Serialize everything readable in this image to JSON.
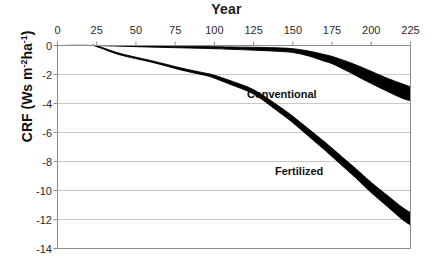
{
  "chart_data": {
    "type": "line",
    "title": "Year",
    "xlabel": "Year",
    "ylabel": "CRF (Ws m-2 ha-1)",
    "ylabel_parts": {
      "prefix": "CRF (Ws m",
      "sup1": "-2",
      "mid": "ha",
      "sup2": "-1",
      "suffix": ")"
    },
    "x_axis_position": "top",
    "xlim": [
      0,
      225
    ],
    "ylim": [
      -14,
      0
    ],
    "xticks": [
      0,
      25,
      50,
      75,
      100,
      125,
      150,
      175,
      200,
      225
    ],
    "xtick_labels": [
      "0",
      "25",
      "50",
      "75",
      "100",
      "125",
      "150",
      "175",
      "200",
      "225"
    ],
    "yticks": [
      0,
      -2,
      -4,
      -6,
      -8,
      -10,
      -12,
      -14
    ],
    "ytick_labels": [
      "0",
      "-2",
      "-4",
      "-6",
      "-8",
      "-10",
      "-12",
      "-14"
    ],
    "grid": "horizontal",
    "grid_color": "#c8c8c8",
    "axis_color": "#808080",
    "legend_position": "inline-annotations",
    "series": [
      {
        "name": "Conventional",
        "color": "#000000",
        "style": "band",
        "x": [
          0,
          25,
          50,
          75,
          100,
          110,
          125,
          140,
          150,
          160,
          170,
          175,
          185,
          195,
          200,
          210,
          220,
          225
        ],
        "values": [
          0.0,
          0.0,
          -0.05,
          -0.1,
          -0.15,
          -0.18,
          -0.22,
          -0.28,
          -0.35,
          -0.55,
          -0.85,
          -1.0,
          -1.45,
          -1.95,
          -2.2,
          -2.7,
          -3.15,
          -3.3
        ],
        "upper": [
          0.0,
          0.0,
          -0.02,
          -0.05,
          -0.08,
          -0.1,
          -0.12,
          -0.16,
          -0.22,
          -0.38,
          -0.62,
          -0.75,
          -1.12,
          -1.55,
          -1.78,
          -2.25,
          -2.65,
          -2.85
        ],
        "lower": [
          0.0,
          0.0,
          -0.08,
          -0.15,
          -0.22,
          -0.26,
          -0.32,
          -0.4,
          -0.48,
          -0.72,
          -1.08,
          -1.25,
          -1.78,
          -2.35,
          -2.62,
          -3.15,
          -3.65,
          -3.8
        ]
      },
      {
        "name": "Fertilized",
        "color": "#000000",
        "style": "band",
        "x": [
          0,
          20,
          25,
          40,
          60,
          80,
          95,
          100,
          110,
          125,
          140,
          150,
          160,
          170,
          180,
          190,
          200,
          210,
          220,
          225
        ],
        "values": [
          0.0,
          0.0,
          -0.05,
          -0.6,
          -1.1,
          -1.65,
          -2.0,
          -2.15,
          -2.55,
          -3.2,
          -4.3,
          -5.1,
          -6.0,
          -6.9,
          -7.85,
          -8.8,
          -9.8,
          -10.7,
          -11.6,
          -11.95
        ],
        "upper": [
          0.0,
          0.0,
          -0.02,
          -0.55,
          -1.05,
          -1.58,
          -1.92,
          -2.05,
          -2.42,
          -3.05,
          -4.1,
          -4.88,
          -5.75,
          -6.62,
          -7.55,
          -8.48,
          -9.45,
          -10.32,
          -11.18,
          -11.52
        ],
        "lower": [
          0.0,
          0.0,
          -0.08,
          -0.65,
          -1.15,
          -1.72,
          -2.08,
          -2.25,
          -2.68,
          -3.35,
          -4.5,
          -5.32,
          -6.25,
          -7.18,
          -8.15,
          -9.12,
          -10.15,
          -11.08,
          -12.02,
          -12.38
        ]
      }
    ],
    "annotations": [
      {
        "text": "Conventional",
        "x": 145,
        "y": -3.0
      },
      {
        "text": "Fertilized",
        "x": 163,
        "y": -7.9
      }
    ]
  }
}
